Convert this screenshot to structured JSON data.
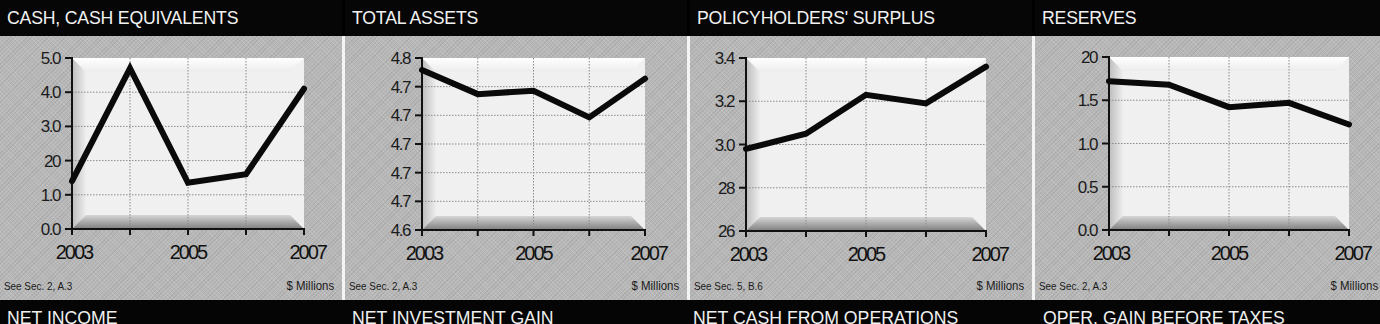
{
  "panels": [
    {
      "title": "CASH, CASH EQUIVALENTS",
      "note": "See Sec. 2, A.3",
      "units": "$ Millions",
      "yticks": [
        "0.0",
        "1.0",
        "20",
        "3.0",
        "4.0",
        "5.0"
      ]
    },
    {
      "title": "TOTAL ASSETS",
      "note": "See Sec. 2, A.3",
      "units": "$ Millions",
      "yticks": [
        "4.6",
        "4.7",
        "4.7",
        "4.7",
        "4.7",
        "4.7",
        "4.8"
      ]
    },
    {
      "title": "POLICYHOLDERS' SURPLUS",
      "note": "See Sec. 5, B.6",
      "units": "$ Millions",
      "yticks": [
        "26",
        "28",
        "3.0",
        "3.2",
        "3.4"
      ]
    },
    {
      "title": "RESERVES",
      "note": "See Sec. 2, A.3",
      "units": "$ Millions",
      "yticks": [
        "0.0",
        "0.5",
        "1.0",
        "1.5",
        "20"
      ]
    }
  ],
  "bottom_titles": [
    "NET INCOME",
    "NET INVESTMENT GAIN",
    "NET CASH FROM OPERATIONS",
    "OPER. GAIN BEFORE TAXES"
  ],
  "colors": {
    "header_bg": "#060606",
    "panel_bg": "#b8b8b8",
    "plot_bg": "#f2f2f2",
    "line": "#0a0a0a"
  },
  "chart_data": [
    {
      "type": "line",
      "title": "CASH, CASH EQUIVALENTS",
      "xlabel": "",
      "ylabel": "$ Millions",
      "x": [
        2003,
        2004,
        2005,
        2006,
        2007
      ],
      "x_tick_labels": [
        "2003",
        "2005",
        "2007"
      ],
      "values": [
        1.4,
        4.7,
        1.35,
        1.6,
        4.1
      ],
      "ylim": [
        0,
        5
      ],
      "y_tick_labels": [
        "0.0",
        "1.0",
        "20",
        "3.0",
        "4.0",
        "5.0"
      ],
      "grid": true,
      "legend": false,
      "annotation": "See Sec. 2, A.3"
    },
    {
      "type": "line",
      "title": "TOTAL ASSETS",
      "xlabel": "",
      "ylabel": "$ Millions",
      "x": [
        2003,
        2004,
        2005,
        2006,
        2007
      ],
      "x_tick_labels": [
        "2003",
        "2005",
        "2007"
      ],
      "values": [
        4.786,
        4.758,
        4.762,
        4.731,
        4.776
      ],
      "ylim": [
        4.6,
        4.8
      ],
      "y_tick_labels": [
        "4.6",
        "4.7",
        "4.7",
        "4.7",
        "4.7",
        "4.7",
        "4.8"
      ],
      "grid": true,
      "legend": false,
      "annotation": "See Sec. 2, A.3"
    },
    {
      "type": "line",
      "title": "POLICYHOLDERS' SURPLUS",
      "xlabel": "",
      "ylabel": "$ Millions",
      "x": [
        2003,
        2004,
        2005,
        2006,
        2007
      ],
      "x_tick_labels": [
        "2003",
        "2005",
        "2007"
      ],
      "values": [
        2.98,
        3.05,
        3.23,
        3.19,
        3.36
      ],
      "ylim": [
        2.6,
        3.4
      ],
      "y_tick_labels": [
        "26",
        "28",
        "3.0",
        "3.2",
        "3.4"
      ],
      "grid": true,
      "legend": false,
      "annotation": "See Sec. 5, B.6"
    },
    {
      "type": "line",
      "title": "RESERVES",
      "xlabel": "",
      "ylabel": "$ Millions",
      "x": [
        2003,
        2004,
        2005,
        2006,
        2007
      ],
      "x_tick_labels": [
        "2003",
        "2005",
        "2007"
      ],
      "values": [
        1.72,
        1.68,
        1.42,
        1.47,
        1.22
      ],
      "ylim": [
        0,
        2
      ],
      "y_tick_labels": [
        "0.0",
        "0.5",
        "1.0",
        "1.5",
        "20"
      ],
      "grid": true,
      "legend": false,
      "annotation": "See Sec. 2, A.3"
    }
  ]
}
